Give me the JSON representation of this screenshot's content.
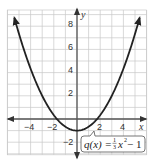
{
  "chart_data": {
    "type": "line",
    "title": "",
    "function": "q(x) = (1/3)x^2 - 1",
    "series": [
      {
        "name": "q(x) = 1/3 x^2 - 1",
        "x": [
          -5.4,
          -5,
          -4,
          -3,
          -2,
          -1.5,
          -1,
          0,
          1,
          1.5,
          2,
          3,
          4,
          5,
          5.4
        ],
        "values": [
          8.72,
          7.33,
          4.33,
          2,
          0.33,
          -0.25,
          -0.67,
          -1,
          -0.67,
          -0.25,
          0.33,
          2,
          4.33,
          7.33,
          8.72
        ]
      }
    ],
    "vertex": [
      0,
      -1
    ],
    "x_intercepts": [
      -1.73,
      1.73
    ],
    "xlabel": "x",
    "ylabel": "y",
    "xlim": [
      -6,
      6
    ],
    "ylim": [
      -3,
      9.4
    ],
    "x_ticks": [
      -4,
      -2,
      2,
      4
    ],
    "y_ticks": [
      -2,
      2,
      4,
      6,
      8
    ],
    "grid": true,
    "grid_step": 1,
    "annotation": "q(x) = 1/3 x^2 - 1"
  },
  "labels": {
    "x_axis": "x",
    "y_axis": "y",
    "x_ticks": [
      "−4",
      "−2",
      "2",
      "4"
    ],
    "y_ticks": [
      "8",
      "6",
      "4",
      "2",
      "−2"
    ],
    "equation": {
      "lhs": "q(x) = ",
      "frac_num": "1",
      "frac_den": "3",
      "var": "x",
      "exp": "2",
      "rhs": " − 1"
    }
  },
  "colors": {
    "curve": "#222222",
    "axis": "#555555",
    "grid": "#c8c8c8"
  }
}
